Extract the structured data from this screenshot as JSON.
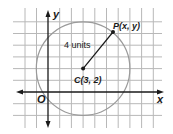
{
  "diagram": {
    "type": "coordinate-plane-circle",
    "axes": {
      "x_label": "x",
      "y_label": "y",
      "origin_label": "O"
    },
    "grid": {
      "spacing_px": 11.7,
      "origin_px": [
        48,
        92
      ],
      "line_color": "#b8b8b8"
    },
    "circle": {
      "center": [
        3,
        2
      ],
      "radius_units": 4,
      "stroke": "#9a9a9a"
    },
    "center_point": {
      "label": "C(3, 2)"
    },
    "point_on_circle": {
      "label": "P(x, y)"
    },
    "radius_label": "4 units"
  }
}
